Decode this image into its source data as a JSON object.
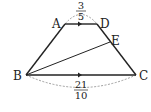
{
  "diagram": {
    "type": "trapezoid",
    "points": {
      "A": {
        "label": "A",
        "x": 65,
        "y": 24
      },
      "D": {
        "label": "D",
        "x": 97,
        "y": 24
      },
      "B": {
        "label": "B",
        "x": 26,
        "y": 75
      },
      "C": {
        "label": "C",
        "x": 136,
        "y": 75
      },
      "E": {
        "label": "E",
        "x": 110,
        "y": 42
      }
    },
    "segments": [
      "AD",
      "AB",
      "DC",
      "BC",
      "BE"
    ],
    "parallel_marks": [
      "AD",
      "BC"
    ],
    "measurements": {
      "AD": {
        "numerator": "3",
        "denominator": "5"
      },
      "BC": {
        "numerator": "21",
        "denominator": "10"
      }
    }
  }
}
